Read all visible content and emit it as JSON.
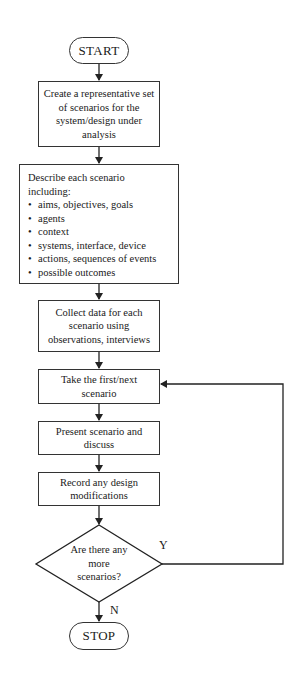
{
  "flowchart": {
    "start": "START",
    "stop": "STOP",
    "steps": [
      {
        "id": "create",
        "text": "Create a representative set of scenarios for the system/design under analysis"
      },
      {
        "id": "describe",
        "heading": "Describe each scenario including:",
        "items": [
          "aims, objectives, goals",
          "agents",
          "context",
          "systems, interface, device",
          "actions, sequences of events",
          "possible outcomes"
        ]
      },
      {
        "id": "collect",
        "text": "Collect data for each scenario using observations, interviews"
      },
      {
        "id": "take",
        "text": "Take the first/next scenario"
      },
      {
        "id": "present",
        "text": "Present scenario and discuss"
      },
      {
        "id": "record",
        "text": "Record any design modifications"
      }
    ],
    "decision": {
      "text": "Are there any more scenarios?",
      "yes_label": "Y",
      "no_label": "N"
    }
  }
}
